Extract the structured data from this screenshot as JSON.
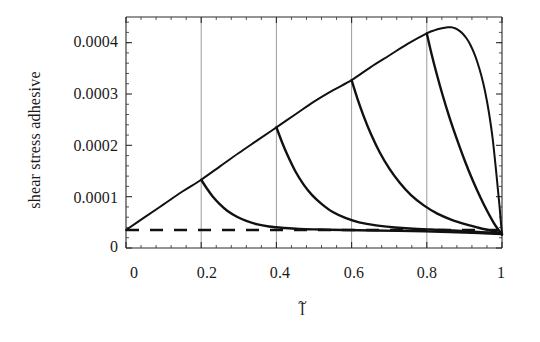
{
  "chart_data": {
    "type": "line",
    "title": "",
    "subtitle": "",
    "xlabel": "l̃",
    "xlabel_base": "l",
    "xlabel_accent": "~",
    "ylabel": "shear stress adhesive",
    "xlim": [
      0,
      1
    ],
    "ylim": [
      0,
      0.00045
    ],
    "grid": true,
    "grid_orientation": "vertical",
    "legend_position": "none",
    "xticks": [
      0,
      0.2,
      0.4,
      0.6,
      0.8,
      1
    ],
    "xtick_labels": [
      "0",
      "0.2",
      "0.4",
      "0.6",
      "0.8",
      "1"
    ],
    "yticks": [
      0,
      0.0001,
      0.0002,
      0.0003,
      0.0004
    ],
    "ytick_labels": [
      "0",
      "0.0001",
      "0.0002",
      "0.0003",
      "0.0004"
    ],
    "minor_ticks_per_interval": 5,
    "line_color": "#111111",
    "grid_color": "#8e8e8e",
    "axis_color": "#2b2b2b",
    "baseline_value": 3.5e-05,
    "series": [
      {
        "name": "envelope",
        "style": "solid",
        "linewidth": 2.0,
        "comment": "monotonic rise from origin to peak then steep drop to baseline at l=1",
        "x": [
          0.0,
          0.05,
          0.1,
          0.15,
          0.2,
          0.25,
          0.3,
          0.35,
          0.4,
          0.45,
          0.5,
          0.55,
          0.6,
          0.65,
          0.7,
          0.75,
          0.8,
          0.82,
          0.84,
          0.855,
          0.865,
          0.875,
          0.885,
          0.895,
          0.905,
          0.915,
          0.925,
          0.935,
          0.945,
          0.955,
          0.965,
          0.975,
          0.985,
          0.993,
          0.998,
          1.0
        ],
        "y": [
          3.5e-05,
          6e-05,
          8.5e-05,
          0.00011,
          0.000133,
          0.000159,
          0.000185,
          0.00021,
          0.000235,
          0.00026,
          0.000285,
          0.000307,
          0.000327,
          0.000352,
          0.000375,
          0.000398,
          0.000418,
          0.000424,
          0.000428,
          0.00043,
          0.00043,
          0.000428,
          0.000424,
          0.000418,
          0.000409,
          0.000397,
          0.000381,
          0.000361,
          0.000336,
          0.000305,
          0.000265,
          0.000214,
          0.000145,
          8.5e-05,
          4.2e-05,
          3e-05
        ]
      },
      {
        "name": "decay-0.2",
        "style": "solid",
        "linewidth": 2.4,
        "x": [
          0.2,
          0.215,
          0.23,
          0.25,
          0.27,
          0.295,
          0.32,
          0.35,
          0.38,
          0.42,
          0.46,
          0.52,
          0.58,
          0.66,
          0.76,
          0.86,
          0.94,
          1.0
        ],
        "y": [
          0.000133,
          0.000116,
          0.000101,
          8.5e-05,
          7.2e-05,
          6.1e-05,
          5.3e-05,
          4.6e-05,
          4.2e-05,
          3.9e-05,
          3.7e-05,
          3.6e-05,
          3.5e-05,
          3.4e-05,
          3.3e-05,
          3.1e-05,
          2.9e-05,
          2.7e-05
        ]
      },
      {
        "name": "decay-0.4",
        "style": "solid",
        "linewidth": 2.4,
        "x": [
          0.4,
          0.415,
          0.43,
          0.45,
          0.472,
          0.495,
          0.52,
          0.55,
          0.585,
          0.62,
          0.665,
          0.715,
          0.775,
          0.845,
          0.915,
          0.965,
          1.0
        ],
        "y": [
          0.000235,
          0.000206,
          0.00018,
          0.00015,
          0.000124,
          0.000103,
          8.6e-05,
          7e-05,
          5.8e-05,
          5e-05,
          4.4e-05,
          4e-05,
          3.7e-05,
          3.5e-05,
          3.2e-05,
          3e-05,
          2.7e-05
        ]
      },
      {
        "name": "decay-0.6",
        "style": "solid",
        "linewidth": 2.4,
        "x": [
          0.6,
          0.615,
          0.632,
          0.652,
          0.675,
          0.7,
          0.728,
          0.758,
          0.792,
          0.828,
          0.866,
          0.904,
          0.94,
          0.97,
          0.99,
          1.0
        ],
        "y": [
          0.000327,
          0.000292,
          0.000257,
          0.000221,
          0.000186,
          0.000155,
          0.000127,
          0.000103,
          8.3e-05,
          6.7e-05,
          5.5e-05,
          4.6e-05,
          3.9e-05,
          3.4e-05,
          3e-05,
          2.7e-05
        ]
      },
      {
        "name": "decay-0.8",
        "style": "solid",
        "linewidth": 2.4,
        "x": [
          0.8,
          0.812,
          0.826,
          0.842,
          0.86,
          0.88,
          0.901,
          0.922,
          0.943,
          0.962,
          0.978,
          0.99,
          0.997,
          1.0
        ],
        "y": [
          0.000418,
          0.00038,
          0.00034,
          0.000298,
          0.000255,
          0.000212,
          0.00017,
          0.000132,
          9.8e-05,
          7e-05,
          4.9e-05,
          3.6e-05,
          2.9e-05,
          2.6e-05
        ]
      },
      {
        "name": "baseline-dashed",
        "style": "dashed",
        "linewidth": 2.6,
        "x": [
          0.0,
          1.0
        ],
        "y": [
          3.5e-05,
          3.5e-05
        ]
      }
    ]
  }
}
